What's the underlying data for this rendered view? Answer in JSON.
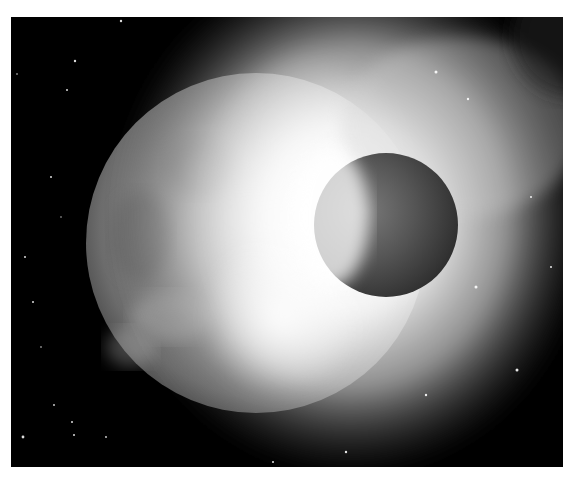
{
  "image": {
    "subject": "planetary collision",
    "description": "Grayscale artistic rendering of a smaller planet colliding with a larger planet, producing a bright white explosion cloud against a starry black sky",
    "palette": {
      "space": "#000000",
      "border": "#ffffff",
      "glow": "#f4f4f4",
      "large_planet": "#8a8a8a",
      "small_planet": "#4a4a4a"
    }
  }
}
